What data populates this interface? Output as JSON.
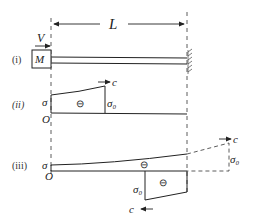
{
  "figure": {
    "dimension_label": "L",
    "panels": [
      {
        "id": "i",
        "label": "(i)",
        "box_label": "M",
        "force_label": "V"
      },
      {
        "id": "ii",
        "label": "(ii)",
        "origin_label": "O",
        "left_label": "σ",
        "step_label": "σ₀",
        "front_label": "c",
        "region_sign": "⊖"
      },
      {
        "id": "iii",
        "label": "(iii)",
        "origin_label": "O",
        "left_label": "σ",
        "upper_sign": "⊖",
        "lower_sign": "⊖",
        "lower_step_label": "σ₀",
        "lower_front_label": "c",
        "ext_label": "σ₀",
        "ext_front_label": "c"
      }
    ]
  },
  "colors": {
    "ink": "#222222",
    "background": "#ffffff"
  }
}
